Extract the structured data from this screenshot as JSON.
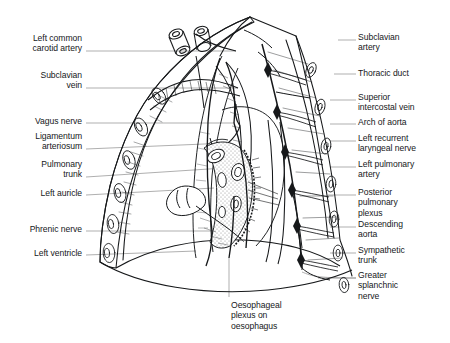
{
  "figure": {
    "type": "anatomical-line-diagram",
    "background_color": "#ffffff",
    "ink_color": "#16181a",
    "leader_line_color": "#8c8c8c",
    "shading_color": "#b4b4b4"
  },
  "labels": {
    "left": [
      {
        "id": "left-common-carotid-artery",
        "lines": [
          "Left common",
          "carotid artery"
        ],
        "x": 82,
        "y": 33,
        "leader": {
          "x1": 86,
          "y1": 51,
          "x2": 236,
          "y2": 51
        }
      },
      {
        "id": "subclavian-vein",
        "lines": [
          "Subclavian",
          "vein"
        ],
        "x": 82,
        "y": 69,
        "leader": {
          "x1": 86,
          "y1": 88,
          "x2": 238,
          "y2": 88
        }
      },
      {
        "id": "vagus-nerve",
        "lines": [
          "Vagus nerve"
        ],
        "x": 82,
        "y": 116,
        "leader": {
          "x1": 86,
          "y1": 123,
          "x2": 234,
          "y2": 123
        }
      },
      {
        "id": "ligamentum-arteriosum",
        "lines": [
          "Ligamentum",
          "arteriosum"
        ],
        "x": 82,
        "y": 131,
        "leader": {
          "x1": 86,
          "y1": 149,
          "x2": 228,
          "y2": 143
        }
      },
      {
        "id": "pulmonary-trunk",
        "lines": [
          "Pulmonary",
          "trunk"
        ],
        "x": 82,
        "y": 159,
        "leader": {
          "x1": 86,
          "y1": 177,
          "x2": 224,
          "y2": 168
        }
      },
      {
        "id": "left-auricle",
        "lines": [
          "Left auricle"
        ],
        "x": 82,
        "y": 188,
        "leader": {
          "x1": 86,
          "y1": 195,
          "x2": 214,
          "y2": 188
        }
      },
      {
        "id": "phrenic-nerve",
        "lines": [
          "Phrenic nerve"
        ],
        "x": 82,
        "y": 224,
        "leader": {
          "x1": 86,
          "y1": 231,
          "x2": 212,
          "y2": 231
        }
      },
      {
        "id": "left-ventricle",
        "lines": [
          "Left ventricle"
        ],
        "x": 82,
        "y": 248,
        "leader": {
          "x1": 86,
          "y1": 255,
          "x2": 196,
          "y2": 251
        }
      }
    ],
    "right": [
      {
        "id": "subclavian-artery",
        "lines": [
          "Subclavian",
          "artery"
        ],
        "x": 358,
        "y": 32,
        "leader": {
          "x1": 338,
          "y1": 40,
          "x2": 356,
          "y2": 40
        }
      },
      {
        "id": "thoracic-duct",
        "lines": [
          "Thoracic duct"
        ],
        "x": 358,
        "y": 67,
        "leader": {
          "x1": 334,
          "y1": 74,
          "x2": 356,
          "y2": 74
        }
      },
      {
        "id": "superior-intercostal-vein",
        "lines": [
          "Superior",
          "intercostal vein"
        ],
        "x": 358,
        "y": 92,
        "leader": {
          "x1": 330,
          "y1": 100,
          "x2": 356,
          "y2": 100
        }
      },
      {
        "id": "arch-of-aorta",
        "lines": [
          "Arch of aorta"
        ],
        "x": 358,
        "y": 117,
        "leader": {
          "x1": 330,
          "y1": 124,
          "x2": 356,
          "y2": 124
        }
      },
      {
        "id": "left-recurrent-laryngeal-nerve",
        "lines": [
          "Left recurrent",
          "laryngeal nerve"
        ],
        "x": 358,
        "y": 133,
        "leader": {
          "x1": 330,
          "y1": 141,
          "x2": 356,
          "y2": 141
        }
      },
      {
        "id": "left-pulmonary-artery",
        "lines": [
          "Left pulmonary",
          "artery"
        ],
        "x": 358,
        "y": 159,
        "leader": {
          "x1": 330,
          "y1": 167,
          "x2": 356,
          "y2": 167
        }
      },
      {
        "id": "posterior-pulmonary-plexus",
        "lines": [
          "Posterior",
          "pulmonary",
          "plexus"
        ],
        "x": 358,
        "y": 187,
        "leader": {
          "x1": 328,
          "y1": 195,
          "x2": 356,
          "y2": 195
        }
      },
      {
        "id": "descending-aorta",
        "lines": [
          "Descending",
          "aorta"
        ],
        "x": 358,
        "y": 219,
        "leader": {
          "x1": 330,
          "y1": 227,
          "x2": 356,
          "y2": 227
        }
      },
      {
        "id": "sympathetic-trunk",
        "lines": [
          "Sympathetic",
          "trunk"
        ],
        "x": 358,
        "y": 245,
        "leader": {
          "x1": 330,
          "y1": 253,
          "x2": 356,
          "y2": 253
        }
      },
      {
        "id": "greater-splanchnic-nerve",
        "lines": [
          "Greater",
          "splanchnic",
          "nerve"
        ],
        "x": 358,
        "y": 270,
        "leader": {
          "x1": 318,
          "y1": 278,
          "x2": 356,
          "y2": 278
        }
      }
    ],
    "bottom": [
      {
        "id": "oesophageal-plexus-on-oesophagus",
        "lines": [
          "Oesophageal",
          "plexus on",
          "oesophagus"
        ],
        "x": 231,
        "y": 300,
        "leader": {
          "x1": 229,
          "y1": 258,
          "x2": 229,
          "y2": 297
        }
      }
    ]
  },
  "structures": {
    "thoracic_wall": "rib-cage-outline",
    "ribs_count": 9,
    "sympathetic_ganglia_count": 6,
    "hilum": "left-lung-root-with-pulmonary-vessels-and-bronchus",
    "diaphragm": "dome-shaped-lower-border",
    "vessel_stumps": "two-cut-great-vessels-at-thoracic-inlet"
  }
}
